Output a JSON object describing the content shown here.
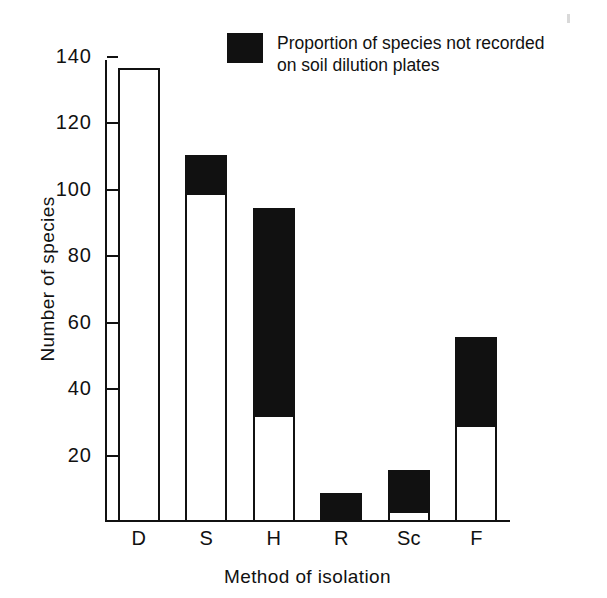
{
  "figure": {
    "background_color": "#ffffff",
    "ink_color": "#111111"
  },
  "legend": {
    "swatch_color": "#111111",
    "line1": "Proportion of species not recorded",
    "line2": "on  soil  dilution plates"
  },
  "chart_data": {
    "type": "bar",
    "subtype": "stacked-bar",
    "title": "",
    "xlabel": "Method of isolation",
    "ylabel": "Number of species",
    "categories": [
      "D",
      "S",
      "H",
      "R",
      "Sc",
      "F"
    ],
    "ylim": [
      0,
      140
    ],
    "yticks": [
      20,
      40,
      60,
      80,
      100,
      120,
      140
    ],
    "ytick_labels": [
      "20",
      "40",
      "60",
      "80",
      "100",
      "120",
      "140"
    ],
    "grid": false,
    "legend_position": "top-right",
    "series": [
      {
        "name": "Proportion of species recorded on soil dilution plates",
        "fill": "#ffffff",
        "values": [
          136,
          98,
          31,
          0,
          2,
          28
        ]
      },
      {
        "name": "Proportion of species not recorded on soil dilution plates",
        "fill": "#111111",
        "values": [
          0,
          12,
          63,
          8,
          13,
          27
        ]
      }
    ],
    "totals": [
      136,
      110,
      94,
      8,
      15,
      55
    ]
  }
}
